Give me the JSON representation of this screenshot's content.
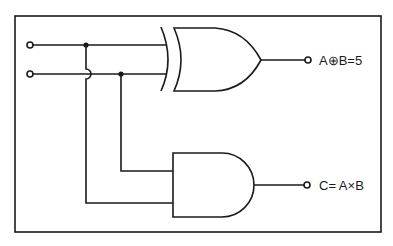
{
  "diagram": {
    "type": "logic-circuit",
    "colors": {
      "line": "#1a1a1a",
      "background": "#ffffff"
    },
    "inputs": [
      {
        "id": "A",
        "label": ""
      },
      {
        "id": "B",
        "label": ""
      }
    ],
    "gates": [
      {
        "id": "xor-gate",
        "type": "XOR",
        "inputs": [
          "A",
          "B"
        ],
        "output": "sum"
      },
      {
        "id": "and-gate",
        "type": "AND",
        "inputs": [
          "A",
          "B"
        ],
        "output": "carry"
      }
    ],
    "outputs": {
      "xor": {
        "label": "A⊕B=5"
      },
      "and": {
        "label": "C= A×B"
      }
    }
  }
}
